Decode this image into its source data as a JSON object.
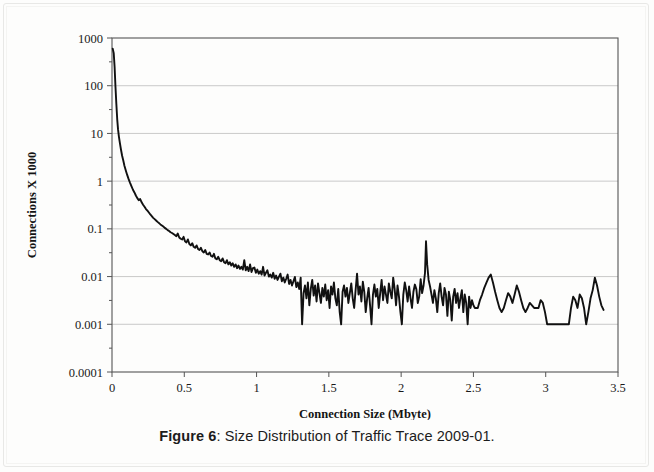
{
  "caption": {
    "label": "Figure 6",
    "separator": ": ",
    "text": "Size Distribution of Traffic Trace 2009-01."
  },
  "chart_data": {
    "type": "line",
    "title": "",
    "xlabel": "Connection Size (Mbyte)",
    "ylabel": "Connections X 1000",
    "xscale": "linear",
    "yscale": "log",
    "xlim": [
      0,
      3.5
    ],
    "ylim": [
      0.0001,
      1000
    ],
    "grid": true,
    "legend": null,
    "xticks": [
      "0",
      "0.5",
      "1",
      "1.5",
      "2",
      "2.5",
      "3",
      "3.5"
    ],
    "xtick_values": [
      0,
      0.5,
      1,
      1.5,
      2,
      2.5,
      3,
      3.5
    ],
    "yticks": [
      "0.0001",
      "0.001",
      "0.01",
      "0.1",
      "1",
      "10",
      "100",
      "1000"
    ],
    "ytick_values": [
      0.0001,
      0.001,
      0.01,
      0.1,
      1,
      10,
      100,
      1000
    ],
    "series": [
      {
        "name": "Traffic Trace 2009-01",
        "color": "#111111",
        "x": [
          0.005,
          0.012,
          0.018,
          0.024,
          0.03,
          0.036,
          0.042,
          0.048,
          0.055,
          0.062,
          0.07,
          0.078,
          0.086,
          0.095,
          0.105,
          0.115,
          0.125,
          0.135,
          0.145,
          0.155,
          0.165,
          0.175,
          0.185,
          0.195,
          0.205,
          0.215,
          0.225,
          0.235,
          0.245,
          0.255,
          0.265,
          0.275,
          0.285,
          0.295,
          0.305,
          0.315,
          0.325,
          0.335,
          0.345,
          0.355,
          0.365,
          0.375,
          0.385,
          0.395,
          0.405,
          0.415,
          0.425,
          0.435,
          0.445,
          0.455,
          0.465,
          0.475,
          0.485,
          0.495,
          0.505,
          0.515,
          0.525,
          0.535,
          0.545,
          0.555,
          0.565,
          0.575,
          0.585,
          0.595,
          0.605,
          0.615,
          0.625,
          0.635,
          0.645,
          0.655,
          0.665,
          0.675,
          0.685,
          0.695,
          0.705,
          0.715,
          0.725,
          0.735,
          0.745,
          0.755,
          0.765,
          0.775,
          0.785,
          0.795,
          0.805,
          0.815,
          0.825,
          0.835,
          0.845,
          0.855,
          0.865,
          0.875,
          0.885,
          0.895,
          0.905,
          0.915,
          0.925,
          0.935,
          0.945,
          0.955,
          0.965,
          0.975,
          0.985,
          0.995,
          1.005,
          1.015,
          1.025,
          1.035,
          1.045,
          1.055,
          1.065,
          1.075,
          1.085,
          1.095,
          1.105,
          1.115,
          1.125,
          1.135,
          1.145,
          1.155,
          1.165,
          1.175,
          1.185,
          1.195,
          1.205,
          1.215,
          1.225,
          1.235,
          1.245,
          1.255,
          1.265,
          1.275,
          1.285,
          1.295,
          1.305,
          1.315,
          1.325,
          1.335,
          1.345,
          1.355,
          1.365,
          1.375,
          1.385,
          1.395,
          1.405,
          1.415,
          1.425,
          1.435,
          1.445,
          1.455,
          1.465,
          1.475,
          1.485,
          1.495,
          1.505,
          1.515,
          1.525,
          1.535,
          1.545,
          1.555,
          1.565,
          1.575,
          1.585,
          1.595,
          1.605,
          1.615,
          1.625,
          1.635,
          1.645,
          1.655,
          1.665,
          1.675,
          1.685,
          1.695,
          1.705,
          1.715,
          1.725,
          1.735,
          1.745,
          1.755,
          1.765,
          1.775,
          1.785,
          1.795,
          1.805,
          1.815,
          1.825,
          1.835,
          1.845,
          1.855,
          1.865,
          1.875,
          1.885,
          1.895,
          1.905,
          1.915,
          1.925,
          1.935,
          1.945,
          1.955,
          1.965,
          1.975,
          1.985,
          1.995,
          2.005,
          2.015,
          2.025,
          2.035,
          2.045,
          2.055,
          2.065,
          2.075,
          2.085,
          2.095,
          2.105,
          2.115,
          2.125,
          2.135,
          2.145,
          2.155,
          2.165,
          2.172,
          2.18,
          2.19,
          2.2,
          2.21,
          2.22,
          2.23,
          2.24,
          2.25,
          2.26,
          2.27,
          2.28,
          2.29,
          2.3,
          2.31,
          2.32,
          2.33,
          2.34,
          2.35,
          2.36,
          2.37,
          2.38,
          2.39,
          2.4,
          2.41,
          2.42,
          2.43,
          2.44,
          2.45,
          2.46,
          2.47,
          2.48,
          2.49,
          2.5,
          2.51,
          2.52,
          2.53,
          2.545,
          2.56,
          2.575,
          2.59,
          2.605,
          2.62,
          2.635,
          2.65,
          2.665,
          2.68,
          2.695,
          2.71,
          2.725,
          2.74,
          2.755,
          2.77,
          2.785,
          2.8,
          2.815,
          2.83,
          2.845,
          2.86,
          2.875,
          2.89,
          2.905,
          2.92,
          2.935,
          2.95,
          2.965,
          2.98,
          2.995,
          3.01,
          3.025,
          3.04,
          3.06,
          3.08,
          3.1,
          3.12,
          3.14,
          3.16,
          3.175,
          3.19,
          3.205,
          3.22,
          3.235,
          3.25,
          3.265,
          3.28,
          3.295,
          3.31,
          3.325,
          3.34,
          3.355,
          3.37,
          3.385,
          3.4
        ],
        "y": [
          600,
          480,
          250,
          95,
          42,
          20,
          12,
          8.5,
          6.2,
          4.6,
          3.4,
          2.7,
          2.1,
          1.7,
          1.35,
          1.1,
          0.92,
          0.78,
          0.66,
          0.58,
          0.5,
          0.44,
          0.4,
          0.42,
          0.36,
          0.32,
          0.29,
          0.26,
          0.24,
          0.22,
          0.2,
          0.185,
          0.17,
          0.16,
          0.15,
          0.14,
          0.132,
          0.124,
          0.118,
          0.112,
          0.105,
          0.1,
          0.094,
          0.09,
          0.085,
          0.082,
          0.078,
          0.074,
          0.07,
          0.08,
          0.066,
          0.062,
          0.06,
          0.068,
          0.055,
          0.052,
          0.06,
          0.048,
          0.045,
          0.05,
          0.042,
          0.04,
          0.045,
          0.038,
          0.036,
          0.04,
          0.034,
          0.032,
          0.036,
          0.03,
          0.029,
          0.032,
          0.027,
          0.026,
          0.03,
          0.024,
          0.023,
          0.026,
          0.022,
          0.021,
          0.024,
          0.02,
          0.019,
          0.022,
          0.018,
          0.02,
          0.017,
          0.019,
          0.016,
          0.018,
          0.015,
          0.017,
          0.0145,
          0.016,
          0.014,
          0.022,
          0.0135,
          0.016,
          0.013,
          0.018,
          0.0125,
          0.015,
          0.0155,
          0.012,
          0.014,
          0.0115,
          0.013,
          0.011,
          0.016,
          0.0105,
          0.012,
          0.0135,
          0.01,
          0.011,
          0.0095,
          0.012,
          0.009,
          0.0105,
          0.0085,
          0.01,
          0.0115,
          0.008,
          0.0095,
          0.0075,
          0.009,
          0.011,
          0.007,
          0.0085,
          0.0065,
          0.008,
          0.0098,
          0.006,
          0.0075,
          0.0055,
          0.0095,
          0.001,
          0.0045,
          0.0065,
          0.0035,
          0.0075,
          0.0025,
          0.0055,
          0.0085,
          0.004,
          0.0065,
          0.003,
          0.0072,
          0.0045,
          0.0028,
          0.0058,
          0.0038,
          0.0068,
          0.0032,
          0.0052,
          0.0022,
          0.0062,
          0.0042,
          0.0075,
          0.0035,
          0.0025,
          0.0055,
          0.0018,
          0.001,
          0.0048,
          0.0065,
          0.0038,
          0.0058,
          0.0028,
          0.0045,
          0.0072,
          0.0035,
          0.0022,
          0.0052,
          0.0115,
          0.0042,
          0.0062,
          0.003,
          0.0078,
          0.0048,
          0.0018,
          0.0035,
          0.0058,
          0.0025,
          0.001,
          0.0042,
          0.0068,
          0.0038,
          0.0055,
          0.0022,
          0.0045,
          0.0085,
          0.0032,
          0.0062,
          0.0042,
          0.0028,
          0.0072,
          0.0048,
          0.0035,
          0.0095,
          0.0055,
          0.0025,
          0.0065,
          0.0038,
          0.0018,
          0.001,
          0.0042,
          0.0075,
          0.0052,
          0.003,
          0.0062,
          0.0035,
          0.0022,
          0.0048,
          0.0068,
          0.0055,
          0.0028,
          0.0038,
          0.0088,
          0.0045,
          0.0065,
          0.012,
          0.055,
          0.018,
          0.0085,
          0.0062,
          0.0042,
          0.0028,
          0.0052,
          0.0035,
          0.0018,
          0.0045,
          0.0072,
          0.0038,
          0.0025,
          0.0058,
          0.0042,
          0.0015,
          0.0048,
          0.0032,
          0.0012,
          0.0038,
          0.0055,
          0.0028,
          0.0045,
          0.0022,
          0.0035,
          0.0052,
          0.0018,
          0.0042,
          0.0028,
          0.001,
          0.0038,
          0.0022,
          0.0032,
          0.0025,
          0.0022,
          0.0022,
          0.0022,
          0.0032,
          0.0042,
          0.0058,
          0.0075,
          0.0095,
          0.011,
          0.0075,
          0.0048,
          0.0032,
          0.0022,
          0.0018,
          0.0022,
          0.0032,
          0.0045,
          0.0038,
          0.0028,
          0.0042,
          0.0065,
          0.0048,
          0.0032,
          0.0022,
          0.0018,
          0.0022,
          0.0028,
          0.0025,
          0.0022,
          0.0022,
          0.0022,
          0.0032,
          0.0028,
          0.0018,
          0.001,
          0.001,
          0.001,
          0.001,
          0.001,
          0.001,
          0.001,
          0.001,
          0.001,
          0.0022,
          0.0038,
          0.0032,
          0.0022,
          0.0042,
          0.0035,
          0.0022,
          0.001,
          0.0018,
          0.0035,
          0.0052,
          0.0095,
          0.0065,
          0.0038,
          0.0025,
          0.002
        ]
      }
    ],
    "annotations": [
      {
        "name": "peak-spike",
        "x": 2.172,
        "y": 0.055,
        "note": "isolated spike"
      },
      {
        "name": "curve-start",
        "x": 0.005,
        "y": 600,
        "note": "maximum value"
      }
    ]
  }
}
